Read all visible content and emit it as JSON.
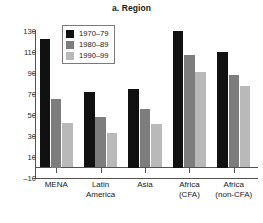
{
  "chart_data": {
    "type": "bar",
    "title": "a. Region",
    "xlabel": "",
    "ylabel": "",
    "ylim": [
      -10,
      130
    ],
    "yticks": [
      130,
      110,
      90,
      70,
      50,
      30,
      10,
      -10
    ],
    "ytick_labels": [
      "130",
      "110",
      "90",
      "70",
      "50",
      "30",
      "10",
      "–10"
    ],
    "grid": false,
    "legend_position": "upper-left-inside",
    "categories": [
      "MENA",
      "Latin America",
      "Asia",
      "Africa (CFA)",
      "Africa (non-CFA)"
    ],
    "category_lines": [
      [
        "MENA"
      ],
      [
        "Latin",
        "America"
      ],
      [
        "Asia"
      ],
      [
        "Africa",
        "(CFA)"
      ],
      [
        "Africa",
        "(non-CFA)"
      ]
    ],
    "series": [
      {
        "name": "1970–79",
        "color": "#111111",
        "values": [
          122,
          72,
          75,
          130,
          110
        ]
      },
      {
        "name": "1980–89",
        "color": "#7d7d7d",
        "values": [
          65,
          48,
          56,
          107,
          88
        ]
      },
      {
        "name": "1990–99",
        "color": "#b9b9b9",
        "values": [
          42,
          33,
          41,
          91,
          78
        ]
      }
    ]
  },
  "colors": {
    "axis": "#55514f",
    "background": "#ffffff",
    "text": "#1a1a1a",
    "series_1970s": "#111111",
    "series_1980s": "#7d7d7d",
    "series_1990s": "#b9b9b9"
  }
}
